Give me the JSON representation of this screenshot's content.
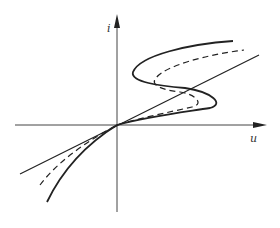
{
  "diagram": {
    "type": "current-voltage characteristic",
    "axes": {
      "x_label": "u",
      "y_label": "i"
    },
    "curves": [
      {
        "name": "linear",
        "style": "solid-thin",
        "description": "straight line through origin"
      },
      {
        "name": "s-curve-strong",
        "style": "solid-thick",
        "description": "S-shaped curve with pronounced fold"
      },
      {
        "name": "s-curve-intermediate",
        "style": "dashed",
        "description": "intermediate S-shaped curve"
      }
    ],
    "colors": {
      "stroke": "#222222",
      "background": "#ffffff"
    }
  }
}
